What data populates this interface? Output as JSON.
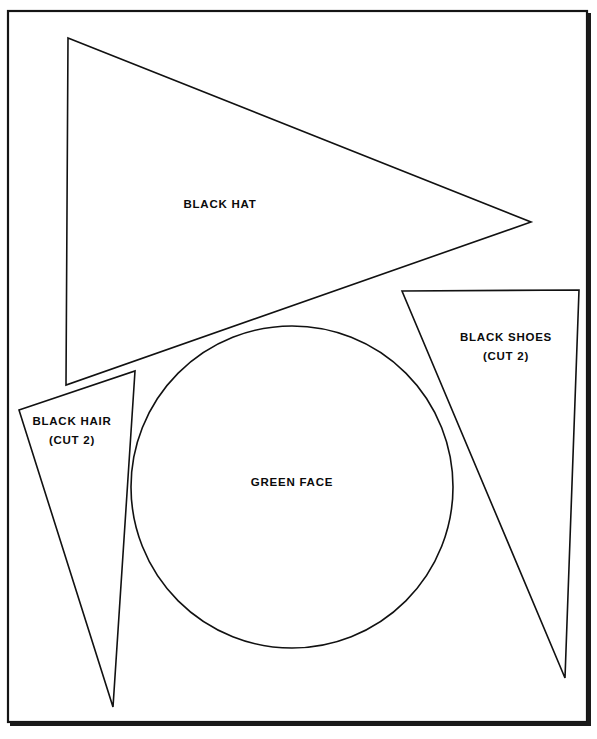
{
  "document": {
    "type": "sewing-pattern-diagram",
    "title": "Costume Pattern Pieces",
    "background_color": "#ffffff",
    "ink_color": "#111111"
  },
  "frame": {
    "name": "page-border",
    "x": 8,
    "y": 11,
    "width": 579,
    "height": 711,
    "stroke_color": "#151515"
  },
  "pieces": [
    {
      "id": "black-hat",
      "label": "BLACK HAT",
      "shape": "triangle",
      "points": "68,38 531,222 66,385"
    },
    {
      "id": "black-hair",
      "label": "BLACK HAIR\n(CUT 2)",
      "shape": "triangle",
      "points": "19,410 135,371 113,707"
    },
    {
      "id": "black-shoes",
      "label": "BLACK SHOES\n(CUT 2)",
      "shape": "triangle",
      "points": "402,291 579,290 565,678"
    },
    {
      "id": "green-face",
      "label": "GREEN FACE",
      "shape": "circle",
      "cx": 292,
      "cy": 487,
      "r": 161
    }
  ]
}
